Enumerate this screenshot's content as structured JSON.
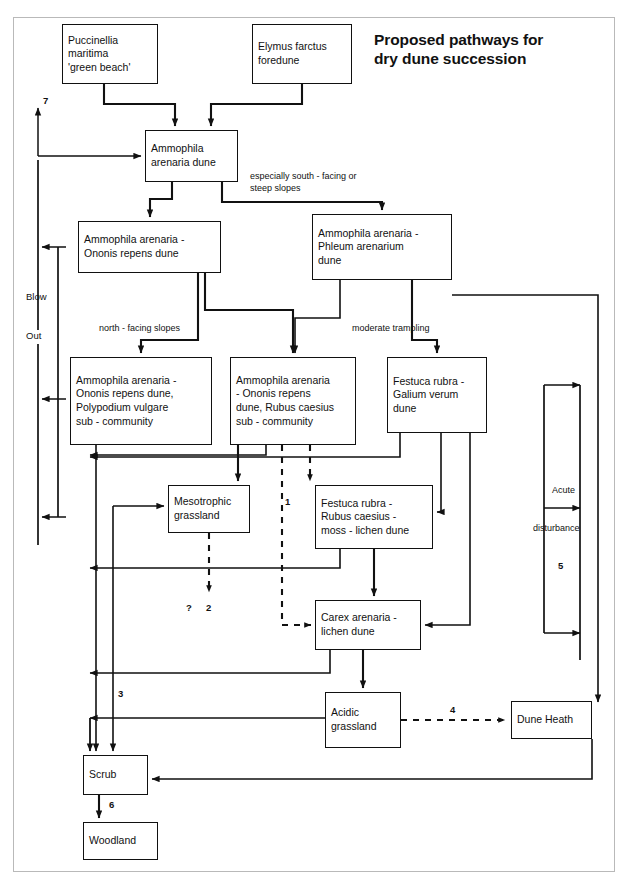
{
  "title": "Proposed pathways for\ndry dune succession",
  "diagram": {
    "type": "flowchart",
    "frame": {
      "stroke": "#b9b9b9"
    },
    "colors": {
      "line": "#111111",
      "box_fill": "#ffffff",
      "box_stroke": "#111111"
    }
  },
  "nodes": [
    {
      "id": "puccinellia",
      "label": "Puccinellia\nmaritima\n'green beach'",
      "x": 62,
      "y": 24,
      "w": 96,
      "h": 60
    },
    {
      "id": "elymus",
      "label": "Elymus farctus\nforedune",
      "x": 252,
      "y": 24,
      "w": 100,
      "h": 60
    },
    {
      "id": "ammophila",
      "label": "Ammophila\narenaria dune",
      "x": 145,
      "y": 130,
      "w": 93,
      "h": 52
    },
    {
      "id": "amm-ononis",
      "label": "Ammophila arenaria -\nOnonis repens dune",
      "x": 78,
      "y": 221,
      "w": 143,
      "h": 52
    },
    {
      "id": "amm-phleum",
      "label": "Ammophila arenaria -\nPhleum arenarium\ndune",
      "x": 312,
      "y": 214,
      "w": 140,
      "h": 66
    },
    {
      "id": "amm-poly",
      "label": "Ammophila arenaria -\nOnonis repens dune,\nPolypodium vulgare\nsub - community",
      "x": 70,
      "y": 357,
      "w": 142,
      "h": 88
    },
    {
      "id": "amm-rubus",
      "label": "Ammophila arenaria\n- Ononis repens\ndune, Rubus caesius\nsub - community",
      "x": 230,
      "y": 357,
      "w": 126,
      "h": 88
    },
    {
      "id": "festuca-gal",
      "label": "Festuca rubra -\nGalium verum\ndune",
      "x": 387,
      "y": 357,
      "w": 100,
      "h": 76
    },
    {
      "id": "mesotrophic",
      "label": "Mesotrophic\ngrassland",
      "x": 168,
      "y": 485,
      "w": 82,
      "h": 48
    },
    {
      "id": "festuca-rub",
      "label": "Festuca rubra -\nRubus caesius -\nmoss - lichen dune",
      "x": 315,
      "y": 485,
      "w": 118,
      "h": 64
    },
    {
      "id": "carex",
      "label": "Carex arenaria -\nlichen dune",
      "x": 315,
      "y": 600,
      "w": 106,
      "h": 50
    },
    {
      "id": "acidic",
      "label": "Acidic\ngrassland",
      "x": 325,
      "y": 692,
      "w": 76,
      "h": 56
    },
    {
      "id": "dune-heath",
      "label": "Dune Heath",
      "x": 511,
      "y": 701,
      "w": 81,
      "h": 38
    },
    {
      "id": "scrub",
      "label": "Scrub",
      "x": 83,
      "y": 755,
      "w": 65,
      "h": 40
    },
    {
      "id": "woodland",
      "label": "Woodland",
      "x": 83,
      "y": 822,
      "w": 75,
      "h": 38
    }
  ],
  "edge_labels": [
    {
      "id": "especially",
      "text": "especially south - facing or\nsteep slopes",
      "x": 250,
      "y": 170
    },
    {
      "id": "north",
      "text": "north - facing slopes",
      "x": 99,
      "y": 322
    },
    {
      "id": "moderate",
      "text": "moderate trampling",
      "x": 352,
      "y": 322
    },
    {
      "id": "acute",
      "text": "Acute",
      "x": 566,
      "y": 488
    },
    {
      "id": "disturbance",
      "text": "disturbance",
      "x": 551,
      "y": 523
    }
  ],
  "side_labels": [
    {
      "id": "blow",
      "text": "Blow",
      "x": 37,
      "y": 291
    },
    {
      "id": "out",
      "text": "Out",
      "x": 37,
      "y": 330
    }
  ],
  "numbers": [
    {
      "id": "n7",
      "text": "7",
      "x": 43,
      "y": 95
    },
    {
      "id": "n1",
      "text": "1",
      "x": 285,
      "y": 496
    },
    {
      "id": "n2",
      "text": "2",
      "x": 206,
      "y": 605
    },
    {
      "id": "q",
      "text": "?",
      "x": 186,
      "y": 604
    },
    {
      "id": "n3",
      "text": "3",
      "x": 111,
      "y": 690
    },
    {
      "id": "n4",
      "text": "4",
      "x": 456,
      "y": 709
    },
    {
      "id": "n5",
      "text": "5",
      "x": 558,
      "y": 565
    },
    {
      "id": "n6",
      "text": "6",
      "x": 109,
      "y": 801
    }
  ],
  "legend_note": "Numbered pathways 1-7 and dashed arrows indicate uncertain or disturbance-driven transitions."
}
